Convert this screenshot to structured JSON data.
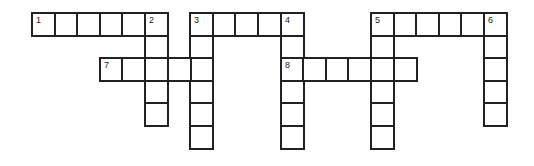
{
  "puzzle": {
    "type": "crossword",
    "cell_size": 22.6,
    "origin": {
      "x": 31,
      "y": 12
    },
    "border_color": "#222222",
    "background": "#ffffff",
    "entries": [
      {
        "number": "1",
        "direction": "across",
        "col": 0,
        "row": 0,
        "length": 6
      },
      {
        "number": "2",
        "direction": "down",
        "col": 5,
        "row": 0,
        "length": 5
      },
      {
        "number": "3",
        "direction": "across",
        "col": 7,
        "row": 0,
        "length": 5
      },
      {
        "number": "3",
        "direction": "down",
        "col": 7,
        "row": 0,
        "length": 6
      },
      {
        "number": "4",
        "direction": "down",
        "col": 11,
        "row": 0,
        "length": 6
      },
      {
        "number": "5",
        "direction": "across",
        "col": 15,
        "row": 0,
        "length": 6
      },
      {
        "number": "5",
        "direction": "down",
        "col": 15,
        "row": 0,
        "length": 6
      },
      {
        "number": "6",
        "direction": "down",
        "col": 20,
        "row": 0,
        "length": 5
      },
      {
        "number": "7",
        "direction": "across",
        "col": 3,
        "row": 2,
        "length": 5
      },
      {
        "number": "8",
        "direction": "across",
        "col": 11,
        "row": 2,
        "length": 6
      }
    ]
  }
}
